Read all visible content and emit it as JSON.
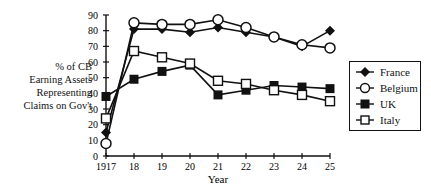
{
  "chart_data": {
    "type": "line",
    "title": "",
    "xlabel": "Year",
    "ylabel": "% of CB Earning Assets Representing Claims on Gov't",
    "ylabel_lines": [
      "% of CB",
      "Earning Assets",
      "Representing",
      "Claims on Gov't"
    ],
    "x": [
      "1917",
      "18",
      "19",
      "20",
      "21",
      "22",
      "23",
      "24",
      "25"
    ],
    "yticks": [
      0,
      10,
      20,
      30,
      40,
      50,
      60,
      70,
      80,
      90
    ],
    "ylim": [
      0,
      90
    ],
    "grid": false,
    "legend_position": "right",
    "series": [
      {
        "name": "France",
        "marker": "filled-diamond",
        "values": [
          15,
          81,
          81,
          79,
          82,
          79,
          76,
          70,
          80
        ]
      },
      {
        "name": "Belgium",
        "marker": "open-circle",
        "values": [
          8,
          85,
          84,
          84,
          87,
          82,
          76,
          71,
          69
        ]
      },
      {
        "name": "UK",
        "marker": "filled-square",
        "values": [
          38,
          49,
          54,
          58,
          39,
          42,
          45,
          44,
          43
        ]
      },
      {
        "name": "Italy",
        "marker": "open-square",
        "values": [
          24,
          67,
          63,
          59,
          48,
          46,
          42,
          39,
          35
        ]
      }
    ]
  }
}
